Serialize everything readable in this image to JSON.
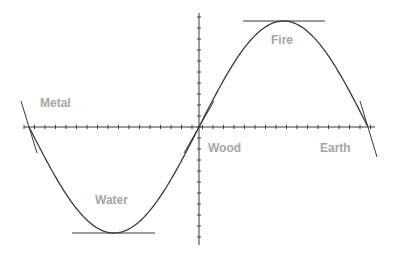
{
  "diagram": {
    "labels": {
      "metal": "Metal",
      "fire": "Fire",
      "wood": "Wood",
      "earth": "Earth",
      "water": "Water"
    },
    "colors": {
      "curve": "#3a3a3a",
      "axis": "#3a3a3a",
      "label": "#a6a6a6",
      "background": "#ffffff"
    },
    "curve": {
      "type": "sine",
      "start_x": 29,
      "end_x": 368,
      "axis_y": 127,
      "trough": {
        "x": 112,
        "y": 233
      },
      "peak": {
        "x": 283,
        "y": 21
      }
    },
    "axes": {
      "horizontal": {
        "x1": 24,
        "x2": 375,
        "y": 127
      },
      "vertical": {
        "x": 199,
        "y1": 13,
        "y2": 245
      }
    }
  }
}
